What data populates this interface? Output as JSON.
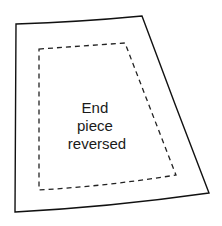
{
  "diagram": {
    "type": "sewing-pattern-piece",
    "label_lines": [
      "End",
      "piece",
      "reversed"
    ],
    "colors": {
      "outline": "#111111",
      "seam_line": "#222222",
      "text": "#1a1a1a",
      "background": "#ffffff"
    },
    "outline": "solid",
    "seam_allowance_line": "dashed"
  }
}
